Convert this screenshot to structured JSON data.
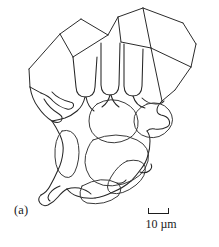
{
  "figure": {
    "panel_label": "(a)",
    "domain": "scientific-line-drawing",
    "background_color": "#ffffff",
    "line_color": "#262626"
  },
  "scale_bar": {
    "label": "10 µm",
    "value": 10,
    "unit": "µm",
    "bracket_length_px": 21,
    "style": "u-bracket"
  },
  "drawing": {
    "description": "Hand-drawn outline of a faceted skeletal crystal. Straight polygonal facet edges bound the upper half; rounded lobate cavities and narrow finger-like slots occupy the interior and lower half.",
    "shapes": {
      "outer_boundary": "M 72 56 L 60 33 L 80 18 L 108 34 L 116 16 L 142 7 L 182 22 L 196 43 L 191 66 L 175 88 L 176 99 L 166 107 L 170 121 L 162 128 L 168 136 L 158 143 L 160 160 L 150 166 L 142 186 L 130 196 L 108 208 L 88 212 L 72 210 L 62 202 L 55 190 L 58 172 L 50 150 L 44 128 L 48 104 L 40 92 L 30 86 L 28 68 Z",
      "facet_edges": [
        "M 60 33 L 28 68",
        "M 28 68 L 30 86",
        "M 30 86 L 40 92",
        "M 80 18 L 60 33",
        "M 60 33 L 72 56",
        "M 80 18 L 108 34",
        "M 108 34 L 104 39",
        "M 116 16 L 108 34",
        "M 142 7 L 116 16",
        "M 142 7 L 182 22",
        "M 182 22 L 196 43",
        "M 196 43 L 191 66",
        "M 191 66 L 175 88",
        "M 142 7 L 150 47",
        "M 150 47 L 191 66",
        "M 150 47 L 121 41",
        "M 121 41 L 116 16",
        "M 150 47 L 159 100",
        "M 175 88 L 159 100"
      ],
      "finger_slots": [
        "M 74 56 L 75 88 q 1 9 9 9 q 9 0 9 -9 L 94 43",
        "M 99 42 L 99 86 q 1 9 9 9 q 9 0 9 -9 L 118 42",
        "M 122 44 L 122 86 q 1 9 9 9 q 9 0 9 -9 L 140 48"
      ],
      "cavities": [
        "M 96 102 q 22 -10 38 6 q 10 12 2 24 q -12 14 -30 10 q -16 -5 -18 -20 q -1 -14 8 -20 Z",
        "M 144 100 q 20 -6 28 10 q 5 14 -8 20 q -18 8 -28 -4 q -8 -12 8 -26 Z",
        "M 92 136 q 30 -10 56 2 q 14 8 10 22 q -6 18 -30 22 q -28 4 -38 -12 q -8 -20 2 -34 Z",
        "M 62 128 q 12 -4 18 8 q 4 16 -2 30 q -8 14 -16 6 q -8 -14 -6 -30 q 1 -12 6 -14 Z",
        "M 128 158 q 18 -4 24 6 q 2 12 -10 22 q -16 12 -30 8 q -8 -6 2 -20 q 8 -12 14 -16 Z",
        "M 80 184 q 24 -12 40 -2 q 8 8 0 16 q -16 10 -36 6 q -12 -6 -4 -20 Z"
      ]
    }
  }
}
